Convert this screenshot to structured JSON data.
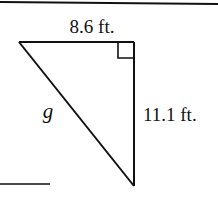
{
  "figure": {
    "type": "right-triangle",
    "labels": {
      "top_side": "8.6 ft.",
      "right_side": "11.1 ft.",
      "hypotenuse": "g"
    },
    "right_angle_marker": true,
    "colors": {
      "stroke": "#111111",
      "background": "#ffffff"
    }
  }
}
